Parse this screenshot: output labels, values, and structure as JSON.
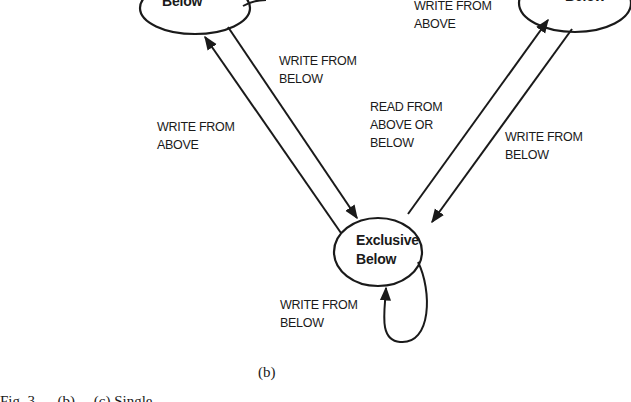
{
  "figure": {
    "subcaption": "(b)",
    "caption_partial": "Fig. 3. ... (b) ... (c) Single ...",
    "states": [
      {
        "id": "shared-below-left",
        "lines": [
          "",
          "Below"
        ]
      },
      {
        "id": "shared-below-right",
        "lines": [
          "",
          "Below"
        ]
      },
      {
        "id": "exclusive-below",
        "lines": [
          "Exclusive",
          "Below"
        ]
      }
    ],
    "transitions": [
      {
        "id": "exclusive-to-left",
        "lines": [
          "WRITE FROM",
          "ABOVE"
        ]
      },
      {
        "id": "left-to-exclusive",
        "lines": [
          "WRITE FROM",
          "BELOW"
        ]
      },
      {
        "id": "right-top",
        "lines": [
          "WRITE FROM",
          "ABOVE"
        ]
      },
      {
        "id": "exclusive-to-right",
        "lines": [
          "READ FROM",
          "ABOVE OR",
          "BELOW"
        ]
      },
      {
        "id": "right-to-exclusive",
        "lines": [
          "WRITE FROM",
          "BELOW"
        ]
      },
      {
        "id": "exclusive-self-loop",
        "lines": [
          "WRITE FROM",
          "BELOW"
        ]
      }
    ],
    "colors": {
      "ink": "#1a1a1a",
      "background": "#ffffff"
    }
  }
}
